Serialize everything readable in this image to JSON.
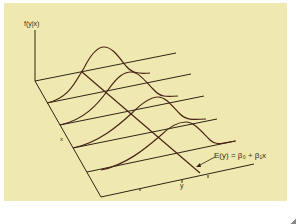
{
  "figure": {
    "background": "#efe8b0",
    "line_color": "#2e2416",
    "curve_color": "#4a2416",
    "labels": {
      "vertical_axis": "f(y|x)",
      "depth_axis": "x",
      "horizontal_axis": "y",
      "regression_line": "E(y) = β₀ + β₁x"
    }
  }
}
